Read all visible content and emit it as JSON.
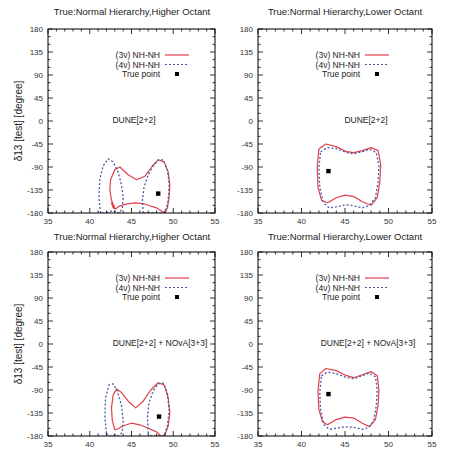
{
  "figure": {
    "ylabel": "δ13 [test] [degree]",
    "xticks": [
      35,
      40,
      45,
      50,
      55
    ],
    "yticks": [
      180,
      135,
      90,
      45,
      0,
      -45,
      -90,
      -135,
      -180
    ],
    "colors": {
      "three_nu": "#e0404a",
      "four_nu": "#4a5aa8",
      "true_point": "#000000",
      "frame": "#000000"
    }
  },
  "chart_data": [
    {
      "type": "line",
      "panel": "top-left",
      "title": "True:Normal Hierarchy,Higher Octant",
      "annotation": "DUNE[2+2]",
      "xlabel": "",
      "ylabel": "δ13 [test] [degree]",
      "xlim": [
        35,
        55
      ],
      "ylim": [
        -180,
        180
      ],
      "legend": [
        "(3ν) NH-NH",
        "(4ν) NH-NH",
        "True point"
      ],
      "true_point": [
        48.2,
        -142
      ],
      "series": [
        {
          "name": "(3ν) NH-NH",
          "style": "solid",
          "x": [
            43.0,
            42.6,
            42.4,
            42.5,
            43.0,
            43.6,
            44.6,
            45.6,
            46.6,
            47.5,
            48.2,
            48.9,
            49.4,
            49.6,
            49.5,
            49.3,
            49.0,
            48.5,
            48.0,
            47.2,
            46.5,
            45.5,
            44.5,
            43.6,
            43.1,
            42.8,
            42.6,
            43.0
          ],
          "y": [
            -170,
            -155,
            -135,
            -115,
            -95,
            -90,
            -105,
            -115,
            -108,
            -88,
            -76,
            -80,
            -100,
            -125,
            -150,
            -170,
            -180,
            -175,
            -170,
            -166,
            -162,
            -160,
            -162,
            -166,
            -172,
            -170,
            -160,
            -170
          ]
        },
        {
          "name": "(4ν) NH-NH",
          "style": "dashed",
          "x": [
            41.3,
            41.1,
            41.2,
            41.6,
            42.2,
            42.8,
            43.4,
            43.8,
            44.0,
            43.9,
            43.6,
            43.2,
            42.8,
            42.3,
            41.8,
            41.3
          ],
          "y": [
            -180,
            -150,
            -115,
            -88,
            -74,
            -80,
            -100,
            -125,
            -150,
            -170,
            -180,
            -178,
            -175,
            -178,
            -180,
            -180
          ]
        },
        {
          "name": "(4ν) NH-NH (right lobe)",
          "style": "dashed",
          "x": [
            46.4,
            46.3,
            46.5,
            47.0,
            47.6,
            48.2,
            48.8,
            49.3,
            49.5,
            49.4,
            49.0,
            48.4,
            47.4,
            46.8,
            46.4
          ],
          "y": [
            -180,
            -155,
            -130,
            -105,
            -88,
            -76,
            -76,
            -95,
            -125,
            -155,
            -180,
            -180,
            -180,
            -180,
            -180
          ]
        }
      ]
    },
    {
      "type": "line",
      "panel": "top-right",
      "title": "True:Normal Hierarchy,Lower Octant",
      "annotation": "DUNE[2+2]",
      "xlim": [
        35,
        55
      ],
      "ylim": [
        -180,
        180
      ],
      "legend": [
        "(3ν) NH-NH",
        "(4ν) NH-NH",
        "True point"
      ],
      "true_point": [
        43.1,
        -98
      ],
      "series": [
        {
          "name": "(3ν) NH-NH",
          "style": "solid",
          "x": [
            42.0,
            42.8,
            44.0,
            45.2,
            46.0,
            47.0,
            48.0,
            48.8,
            49.1,
            49.0,
            48.7,
            48.0,
            47.0,
            46.0,
            45.0,
            44.0,
            43.0,
            42.3,
            41.9,
            41.8,
            42.0
          ],
          "y": [
            -55,
            -45,
            -50,
            -60,
            -62,
            -58,
            -52,
            -58,
            -85,
            -120,
            -150,
            -165,
            -158,
            -148,
            -145,
            -150,
            -160,
            -155,
            -130,
            -90,
            -55
          ]
        },
        {
          "name": "(4ν) NH-NH",
          "style": "dashed",
          "x": [
            42.2,
            43.0,
            44.0,
            45.2,
            46.0,
            47.0,
            47.8,
            48.6,
            48.9,
            48.8,
            48.5,
            47.8,
            47.0,
            46.0,
            45.0,
            44.0,
            43.2,
            42.5,
            42.1,
            42.0,
            42.2
          ],
          "y": [
            -60,
            -52,
            -54,
            -62,
            -64,
            -60,
            -55,
            -62,
            -88,
            -120,
            -150,
            -165,
            -170,
            -166,
            -164,
            -168,
            -170,
            -160,
            -130,
            -92,
            -60
          ]
        }
      ]
    },
    {
      "type": "line",
      "panel": "bottom-left",
      "title": "True:Normal Hierarchy,Higher Octant",
      "annotation": "DUNE[2+2] + NOvA[3+3]",
      "xlabel": "",
      "ylabel": "δ13 [test] [degree]",
      "xlim": [
        35,
        55
      ],
      "ylim": [
        -180,
        180
      ],
      "legend": [
        "(3ν) NH-NH",
        "(4ν) NH-NH",
        "True point"
      ],
      "true_point": [
        48.3,
        -142
      ],
      "series": [
        {
          "name": "(3ν) NH-NH",
          "style": "solid",
          "x": [
            43.0,
            42.7,
            42.6,
            42.8,
            43.2,
            43.8,
            44.6,
            45.5,
            46.4,
            47.3,
            48.2,
            48.9,
            49.4,
            49.6,
            49.4,
            49.0,
            48.5,
            48.0,
            47.0,
            46.0,
            45.0,
            44.0,
            43.4,
            43.0
          ],
          "y": [
            -168,
            -150,
            -125,
            -100,
            -88,
            -95,
            -112,
            -125,
            -112,
            -90,
            -76,
            -80,
            -105,
            -135,
            -160,
            -178,
            -180,
            -172,
            -165,
            -158,
            -155,
            -160,
            -166,
            -168
          ]
        },
        {
          "name": "(4ν) NH-NH",
          "style": "dashed",
          "x": [
            42.0,
            41.8,
            41.9,
            42.3,
            42.8,
            43.3,
            43.8,
            44.0,
            43.9,
            43.5,
            43.0,
            42.5,
            42.0
          ],
          "y": [
            -175,
            -140,
            -105,
            -80,
            -78,
            -92,
            -120,
            -150,
            -172,
            -180,
            -178,
            -180,
            -175
          ]
        },
        {
          "name": "(4ν) NH-NH (right lobe)",
          "style": "dashed",
          "x": [
            47.0,
            46.9,
            47.1,
            47.6,
            48.2,
            48.8,
            49.3,
            49.5,
            49.3,
            48.9,
            48.2,
            47.4,
            47.0
          ],
          "y": [
            -175,
            -145,
            -115,
            -92,
            -78,
            -76,
            -95,
            -130,
            -160,
            -180,
            -180,
            -180,
            -175
          ]
        }
      ]
    },
    {
      "type": "line",
      "panel": "bottom-right",
      "title": "True:Normal Hierarchy,Lower Octant",
      "annotation": "DUNE[2+2] + NOvA[3+3]",
      "xlim": [
        35,
        55
      ],
      "ylim": [
        -180,
        180
      ],
      "legend": [
        "(3ν) NH-NH",
        "(4ν) NH-NH",
        "True point"
      ],
      "true_point": [
        43.1,
        -98
      ],
      "series": [
        {
          "name": "(3ν) NH-NH",
          "style": "solid",
          "x": [
            42.1,
            42.8,
            44.0,
            45.2,
            46.0,
            47.0,
            48.0,
            48.7,
            48.9,
            48.8,
            48.5,
            47.8,
            47.0,
            46.0,
            45.0,
            44.0,
            43.0,
            42.4,
            42.0,
            41.9,
            42.1
          ],
          "y": [
            -58,
            -48,
            -52,
            -62,
            -66,
            -60,
            -54,
            -62,
            -90,
            -120,
            -148,
            -162,
            -155,
            -145,
            -143,
            -148,
            -158,
            -152,
            -128,
            -92,
            -58
          ]
        },
        {
          "name": "(4ν) NH-NH",
          "style": "dashed",
          "x": [
            42.3,
            43.0,
            44.0,
            45.2,
            46.0,
            47.0,
            47.8,
            48.5,
            48.7,
            48.6,
            48.3,
            47.7,
            47.0,
            46.0,
            45.0,
            44.0,
            43.2,
            42.6,
            42.2,
            42.1,
            42.3
          ],
          "y": [
            -62,
            -55,
            -58,
            -66,
            -68,
            -62,
            -57,
            -64,
            -90,
            -120,
            -150,
            -163,
            -167,
            -163,
            -162,
            -165,
            -167,
            -158,
            -130,
            -94,
            -62
          ]
        }
      ]
    }
  ]
}
